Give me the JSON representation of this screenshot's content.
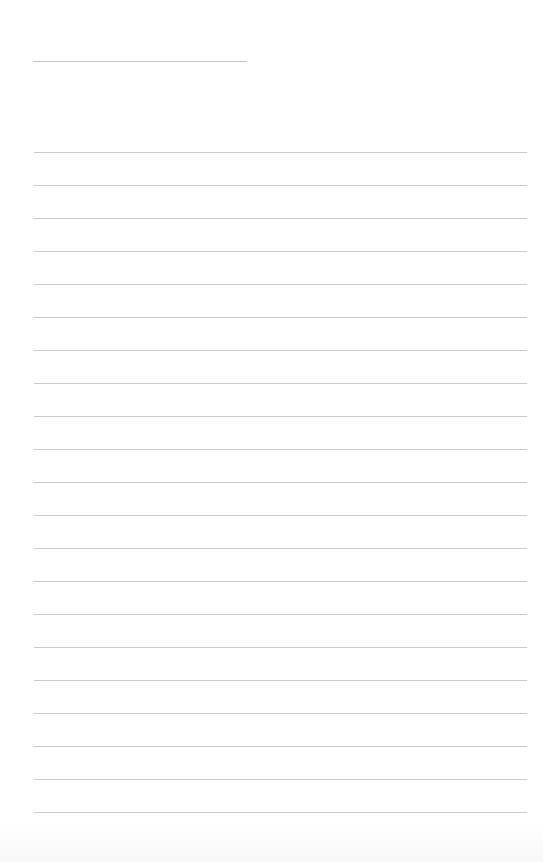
{
  "page": {
    "type": "lined-paper",
    "background_color": "#ffffff",
    "line_color": "#c8c8c8",
    "title_line": {
      "text": "",
      "x": 33,
      "y": 61,
      "width": 214
    },
    "ruled_lines": {
      "count": 21,
      "start_y": 152,
      "spacing": 33,
      "x": 34,
      "width": 493,
      "texts": [
        "",
        "",
        "",
        "",
        "",
        "",
        "",
        "",
        "",
        "",
        "",
        "",
        "",
        "",
        "",
        "",
        "",
        "",
        "",
        "",
        ""
      ]
    }
  }
}
